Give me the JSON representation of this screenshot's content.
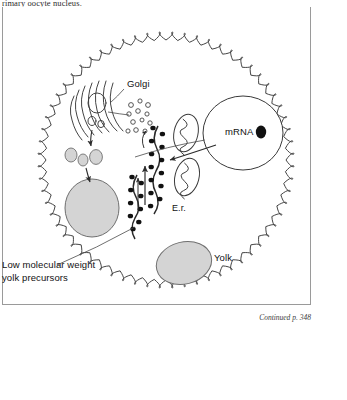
{
  "page": {
    "running_text": "rimary oocyte nucleus.",
    "continued_note": "Continued p. 348"
  },
  "figure": {
    "labels": {
      "golgi": "Golgi",
      "mrna": "mRNA",
      "er": "E.r.",
      "yolk": "Yolk",
      "low_molecular_line1": "Low molecular weight",
      "low_molecular_line2": "yolk precursors"
    },
    "colors": {
      "outline": "#3a3a3a",
      "organelle_fill": "#d4d4d4",
      "organelle_stroke": "#6f6f6f",
      "nucleolus": "#111111",
      "frame": "#9a9a9a",
      "text": "#111111"
    },
    "structures": [
      {
        "name": "cell-membrane-microvilli",
        "shape": "wavy-circle"
      },
      {
        "name": "golgi-apparatus",
        "shape": "stacked-cisternae"
      },
      {
        "name": "transport-vesicles",
        "count": 12,
        "shape": "small-open-circles"
      },
      {
        "name": "rough-endoplasmic-reticulum",
        "shape": "ribosome-studded-strands"
      },
      {
        "name": "mitochondrion-upper",
        "shape": "ellipse-with-cristae"
      },
      {
        "name": "mitochondrion-lower",
        "shape": "ellipse-with-cristae"
      },
      {
        "name": "nucleus",
        "shape": "large-circle"
      },
      {
        "name": "nucleolus",
        "shape": "filled-dot"
      },
      {
        "name": "yolk-body-left",
        "shape": "gray-ellipse"
      },
      {
        "name": "yolk-body-bottom",
        "shape": "gray-ellipse"
      },
      {
        "name": "golgi-derived-vesicles",
        "count": 3,
        "shape": "gray-ovals"
      }
    ]
  }
}
